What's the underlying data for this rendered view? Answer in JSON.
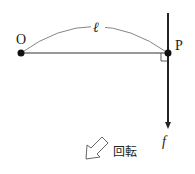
{
  "diagram": {
    "points": {
      "O": {
        "label": "O",
        "x": 21,
        "y": 53
      },
      "P": {
        "label": "P",
        "x": 168,
        "y": 53
      }
    },
    "length_label": "ℓ",
    "force_label": "f",
    "rotation_label": "回転",
    "colors": {
      "line": "#222222",
      "arc": "#666666",
      "background": "#ffffff"
    }
  }
}
